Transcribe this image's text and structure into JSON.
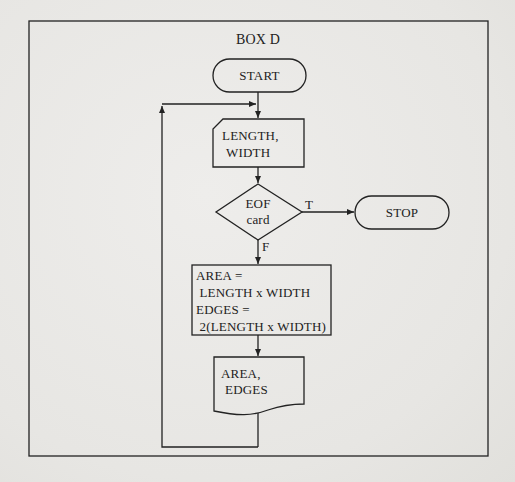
{
  "title": "BOX D",
  "colors": {
    "paper": "#e9e8e6",
    "ink": "#222222"
  },
  "nodes": {
    "start": {
      "type": "terminal",
      "label": "START"
    },
    "input": {
      "type": "card-input",
      "lines": [
        "LENGTH,",
        "WIDTH"
      ]
    },
    "decision": {
      "type": "decision",
      "lines": [
        "EOF",
        "card"
      ]
    },
    "stop": {
      "type": "terminal",
      "label": "STOP"
    },
    "process": {
      "type": "process",
      "lines": [
        "AREA =",
        " LENGTH x WIDTH",
        "EDGES =",
        " 2(LENGTH x WIDTH)"
      ]
    },
    "output": {
      "type": "document",
      "lines": [
        "AREA,",
        "EDGES"
      ]
    }
  },
  "edges": [
    {
      "from": "start",
      "to": "input",
      "label": ""
    },
    {
      "from": "input",
      "to": "decision",
      "label": ""
    },
    {
      "from": "decision",
      "to": "stop",
      "label": "T"
    },
    {
      "from": "decision",
      "to": "process",
      "label": "F"
    },
    {
      "from": "process",
      "to": "output",
      "label": ""
    },
    {
      "from": "output",
      "to": "input",
      "label": "",
      "kind": "loop-back"
    }
  ]
}
